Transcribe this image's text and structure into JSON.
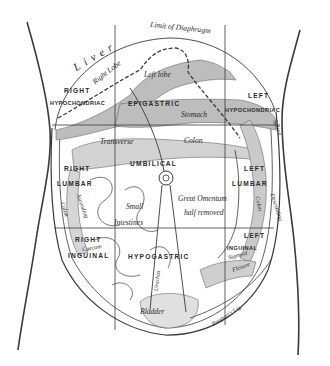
{
  "figure": {
    "ink_color": "#3a3a3a",
    "shade_color": "#bdbdbd",
    "background": "#ffffff"
  },
  "labels": {
    "limit_of_diaphragm": "Limit of Diaphragm",
    "liver": "Liver",
    "right_lobe": "Right Lobe",
    "left_lobe": "Left lobe",
    "right_hypochondriac_1": "RIGHT",
    "right_hypochondriac_2": "HYPOCHONDRIAC",
    "epigastric": "EPIGASTRIC",
    "left_hypochondriac_1": "LEFT",
    "left_hypochondriac_2": "HYPOCHONDRIAC",
    "stomach": "Stomach",
    "transverse": "Transverse",
    "colon_transverse": "Colon",
    "spleen": "Spleen",
    "umbilical": "UMBILICAL",
    "right_lumbar_1": "RIGHT",
    "right_lumbar_2": "LUMBAR",
    "left_lumbar_1": "LEFT",
    "left_lumbar_2": "LUMBAR",
    "ascending": "Ascending",
    "colon_ascending": "Colon",
    "descending": "Descending",
    "colon_descending": "Colon",
    "small": "Small",
    "intestines": "Intestines",
    "great_omentum": "Great Omentum",
    "half_removed": "half removed",
    "right_inguinal_1": "RIGHT",
    "right_inguinal_2": "INGUINAL",
    "caecum": "Caecum",
    "hypogastric": "HYPOGASTRIC",
    "left_inguinal_1": "LEFT",
    "left_inguinal_2": "INGUINAL",
    "sigmoid": "Sigmoid",
    "flexure": "Flexure",
    "urachus": "Urachus",
    "bladder": "Bladder",
    "pouparts_lig": "Poupart's Lig."
  }
}
